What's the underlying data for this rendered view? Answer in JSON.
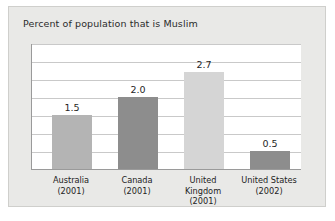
{
  "chart_data": {
    "type": "bar",
    "title": "Percent of population that is Muslim",
    "xlabel": "",
    "ylabel": "",
    "ylim": [
      0,
      3.5
    ],
    "grid": true,
    "gridline_count": 7,
    "legend": "none",
    "categories": [
      "Australia (2001)",
      "Canada (2001)",
      "United Kingdom (2001)",
      "United States (2002)"
    ],
    "values": [
      1.5,
      2.0,
      2.7,
      0.5
    ],
    "value_labels": [
      "1.5",
      "2.0",
      "2.7",
      "0.5"
    ],
    "bars": [
      {
        "name": "Australia",
        "year": "(2001)",
        "value": 1.5,
        "label": "1.5",
        "color": "#b4b4b4"
      },
      {
        "name": "Canada",
        "year": "(2001)",
        "value": 2.0,
        "label": "2.0",
        "color": "#8d8d8d"
      },
      {
        "name": "United",
        "name2": "Kingdom",
        "year": "(2001)",
        "value": 2.7,
        "label": "2.7",
        "color": "#d5d5d5"
      },
      {
        "name": "United States",
        "year": "(2002)",
        "value": 0.5,
        "label": "0.5",
        "color": "#8d8d8d"
      }
    ]
  },
  "colors": {
    "card_background": "#e9e9e7",
    "plot_background": "#ffffff",
    "gridline": "#c9c9c9",
    "axis": "#9a9a9a",
    "text": "#232323"
  }
}
